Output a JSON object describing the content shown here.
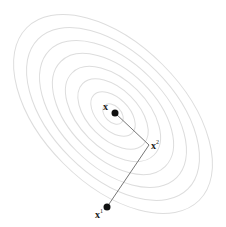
{
  "diagram": {
    "colors": {
      "contour": "#dddddd",
      "path": "#777777",
      "point": "#111111",
      "background": "#ffffff"
    },
    "contours": {
      "center": [
        113,
        114
      ],
      "rotation_deg": 45,
      "count": 8,
      "radii": [
        [
          12,
          8
        ],
        [
          27,
          16
        ],
        [
          43,
          25
        ],
        [
          58,
          34
        ],
        [
          74,
          43
        ],
        [
          90,
          52
        ],
        [
          106,
          61
        ],
        [
          122,
          70
        ]
      ]
    },
    "points": [
      {
        "id": "x_star",
        "label": "x",
        "superscript": "*",
        "pos": [
          115,
          113
        ],
        "filled": true
      },
      {
        "id": "x_2",
        "label": "x",
        "superscript": "2",
        "pos": [
          149,
          145
        ],
        "filled": false
      },
      {
        "id": "x_1",
        "label": "x",
        "superscript": "1",
        "pos": [
          107,
          207
        ],
        "filled": true
      }
    ],
    "path": [
      [
        107,
        207
      ],
      [
        149,
        145
      ],
      [
        115,
        113
      ]
    ],
    "labels": {
      "x_star": "x",
      "x_star_sup": "",
      "x_2": "x",
      "x_2_sup": "2",
      "x_1": "x",
      "x_1_sup": "1"
    }
  }
}
